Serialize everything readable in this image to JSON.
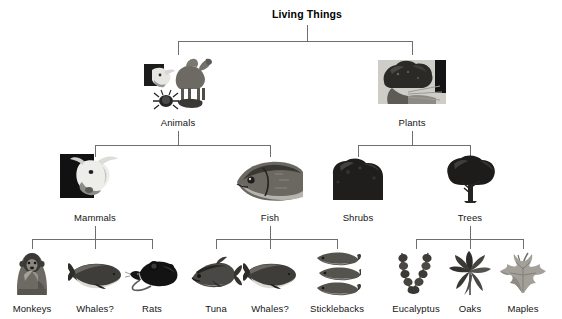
{
  "diagram": {
    "title": "Living Things",
    "type": "hierarchy-tree",
    "levels": 4,
    "line_color": "#6f6f6f",
    "background": "#ffffff",
    "text_color": "#151515"
  },
  "root": {
    "label": "Living Things",
    "x": 307,
    "y": 8
  },
  "level2": [
    {
      "label": "Animals",
      "x": 178,
      "y": 117,
      "image": "camel-cow-beetle-collage"
    },
    {
      "label": "Plants",
      "x": 412,
      "y": 117,
      "image": "tree-plant-photo"
    }
  ],
  "level3": [
    {
      "label": "Mammals",
      "x": 95,
      "y": 212,
      "image": "cow-head-photo",
      "parent": "Animals"
    },
    {
      "label": "Fish",
      "x": 270,
      "y": 212,
      "image": "fish-head-photo",
      "parent": "Animals"
    },
    {
      "label": "Shrubs",
      "x": 358,
      "y": 212,
      "image": "shrub-silhouette",
      "parent": "Plants"
    },
    {
      "label": "Trees",
      "x": 470,
      "y": 212,
      "image": "tree-silhouette",
      "parent": "Plants"
    }
  ],
  "level4": [
    {
      "label": "Monkeys",
      "x": 32,
      "y": 303,
      "image": "monkey-photo",
      "parent": "Mammals"
    },
    {
      "label": "Whales?",
      "x": 95,
      "y": 303,
      "image": "whale-photo",
      "parent": "Mammals"
    },
    {
      "label": "Rats",
      "x": 152,
      "y": 303,
      "image": "rat-silhouette",
      "parent": "Mammals"
    },
    {
      "label": "Tuna",
      "x": 216,
      "y": 303,
      "image": "tuna-photo",
      "parent": "Fish"
    },
    {
      "label": "Whales?",
      "x": 270,
      "y": 303,
      "image": "whale-photo",
      "parent": "Fish"
    },
    {
      "label": "Sticklebacks",
      "x": 337,
      "y": 303,
      "image": "sticklebacks-photo",
      "parent": "Fish"
    },
    {
      "label": "Eucalyptus",
      "x": 416,
      "y": 303,
      "image": "eucalyptus-leaves",
      "parent": "Trees"
    },
    {
      "label": "Oaks",
      "x": 470,
      "y": 303,
      "image": "oak-leaf",
      "parent": "Trees"
    },
    {
      "label": "Maples",
      "x": 523,
      "y": 303,
      "image": "maple-leaf",
      "parent": "Trees"
    }
  ],
  "icons": {
    "camel": "camel-icon",
    "cow_head": "cow-head-icon",
    "beetle": "beetle-icon",
    "plant_photo": "plant-photo-icon",
    "fish_head": "fish-head-icon",
    "shrub": "shrub-icon",
    "tree": "tree-icon",
    "monkey": "monkey-icon",
    "whale": "whale-icon",
    "rat": "rat-icon",
    "tuna": "tuna-icon",
    "stickleback": "stickleback-icon",
    "eucalyptus": "eucalyptus-icon",
    "oak_leaf": "oak-leaf-icon",
    "maple_leaf": "maple-leaf-icon"
  }
}
